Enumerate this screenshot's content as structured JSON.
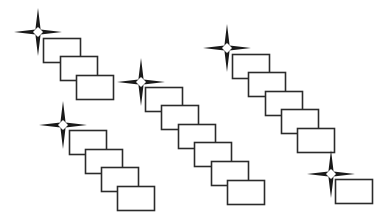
{
  "diagram": {
    "background": "#ffffff",
    "stroke_color": "#2b2b2b",
    "star_color": "#1a1a1a",
    "rect_size": {
      "w": 37,
      "h": 24
    },
    "groups": [
      {
        "name": "group-top-left",
        "star": {
          "x": 38,
          "y": 32,
          "arm": 24
        },
        "rects": [
          [
            43,
            38
          ],
          [
            60,
            56
          ],
          [
            76,
            75
          ]
        ]
      },
      {
        "name": "group-bottom-left",
        "star": {
          "x": 63,
          "y": 125,
          "arm": 24
        },
        "rects": [
          [
            69,
            130
          ],
          [
            85,
            149
          ],
          [
            101,
            167
          ],
          [
            117,
            186
          ]
        ]
      },
      {
        "name": "group-middle",
        "star": {
          "x": 141,
          "y": 82,
          "arm": 24
        },
        "rects": [
          [
            145,
            87
          ],
          [
            161,
            105
          ],
          [
            178,
            124
          ],
          [
            194,
            142
          ],
          [
            211,
            161
          ],
          [
            227,
            180
          ]
        ]
      },
      {
        "name": "group-top-right",
        "star": {
          "x": 227,
          "y": 48,
          "arm": 24
        },
        "rects": [
          [
            232,
            54
          ],
          [
            248,
            72
          ],
          [
            265,
            91
          ],
          [
            281,
            109
          ],
          [
            297,
            128
          ]
        ]
      },
      {
        "name": "group-bottom-right",
        "star": {
          "x": 331,
          "y": 174,
          "arm": 24
        },
        "rects": [
          [
            335,
            179
          ]
        ]
      }
    ]
  }
}
